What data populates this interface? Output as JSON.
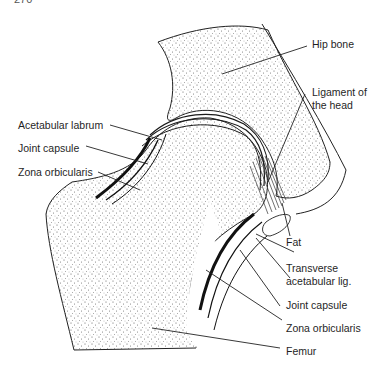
{
  "page": {
    "number": "270"
  },
  "figure": {
    "labels": {
      "hip_bone": "Hip bone",
      "ligament_of_head_line1": "Ligament of",
      "ligament_of_head_line2": "the head",
      "acetabular_labrum": "Acetabular labrum",
      "joint_capsule_left": "Joint capsule",
      "zona_orbicularis_left": "Zona orbicularis",
      "fat": "Fat",
      "transverse_line1": "Transverse",
      "transverse_line2": "acetabular lig.",
      "joint_capsule_right": "Joint capsule",
      "zona_orbicularis_right": "Zona orbicularis",
      "femur": "Femur"
    },
    "colors": {
      "ink": "#1a1a1a",
      "stipple": "#555555",
      "background": "#ffffff"
    }
  }
}
